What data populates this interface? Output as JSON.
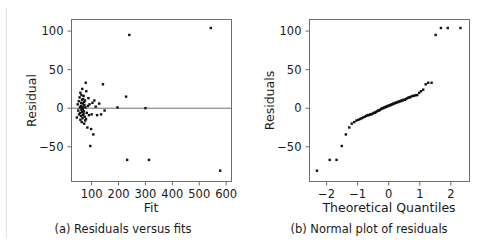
{
  "figure": {
    "panels": [
      {
        "id": "a",
        "caption": "(a) Residuals versus fits"
      },
      {
        "id": "b",
        "caption": "(b) Normal plot of residuals"
      }
    ]
  },
  "chart_data": [
    {
      "type": "scatter",
      "id": "residuals-versus-fits",
      "title": "(a) Residuals versus fits",
      "xlabel": "Fit",
      "ylabel": "Residual",
      "xlim": [
        25,
        620
      ],
      "ylim": [
        -95,
        115
      ],
      "xticks": [
        100,
        200,
        300,
        400,
        500,
        600
      ],
      "xtick_labels": [
        "100",
        "200",
        "300",
        "400",
        "500",
        "600"
      ],
      "yticks": [
        -50,
        0,
        50,
        100
      ],
      "ytick_labels": [
        "−50",
        "0",
        "50",
        "100"
      ],
      "grid": false,
      "legend": false,
      "reference_line": {
        "orientation": "horizontal",
        "y": 0
      },
      "marker": {
        "shape": "square",
        "size": 2.4,
        "color": "#111111"
      },
      "x": [
        45,
        48,
        50,
        52,
        53,
        55,
        56,
        57,
        58,
        58,
        60,
        60,
        61,
        62,
        62,
        63,
        64,
        64,
        65,
        65,
        66,
        67,
        67,
        68,
        68,
        69,
        70,
        70,
        71,
        72,
        72,
        73,
        74,
        75,
        76,
        77,
        78,
        79,
        80,
        82,
        84,
        86,
        88,
        90,
        92,
        95,
        98,
        100,
        103,
        106,
        110,
        115,
        120,
        128,
        135,
        142,
        148,
        196,
        228,
        232,
        240,
        300,
        313,
        543,
        578
      ],
      "y": [
        -12,
        5,
        -3,
        9,
        -8,
        14,
        1,
        -6,
        20,
        -15,
        3,
        -10,
        7,
        -2,
        17,
        -18,
        11,
        0,
        -5,
        25,
        -13,
        6,
        -1,
        12,
        -9,
        2,
        -7,
        16,
        -4,
        8,
        -20,
        4,
        -11,
        10,
        -16,
        1,
        33,
        -14,
        22,
        -6,
        -25,
        3,
        13,
        -9,
        5,
        -49,
        -27,
        -8,
        7,
        -34,
        10,
        2,
        -9,
        6,
        -8,
        31,
        -3,
        1,
        15,
        -67,
        95,
        0,
        -67,
        104,
        -81
      ]
    },
    {
      "type": "scatter",
      "id": "normal-plot-of-residuals",
      "title": "(b) Normal plot of residuals",
      "xlabel": "Theoretical Quantiles",
      "ylabel": "Residuals",
      "xlim": [
        -2.55,
        2.6
      ],
      "ylim": [
        -95,
        115
      ],
      "xticks": [
        -2,
        -1,
        0,
        1,
        2
      ],
      "xtick_labels": [
        "−2",
        "−1",
        "0",
        "1",
        "2"
      ],
      "yticks": [
        -50,
        0,
        50,
        100
      ],
      "ytick_labels": [
        "−50",
        "0",
        "50",
        "100"
      ],
      "grid": false,
      "legend": false,
      "marker": {
        "shape": "square",
        "size": 2.4,
        "color": "#111111"
      },
      "x": [
        -2.31,
        -1.9,
        -1.68,
        -1.51,
        -1.38,
        -1.27,
        -1.19,
        -1.11,
        -1.04,
        -0.98,
        -0.92,
        -0.87,
        -0.82,
        -0.77,
        -0.72,
        -0.68,
        -0.64,
        -0.6,
        -0.56,
        -0.52,
        -0.48,
        -0.45,
        -0.41,
        -0.38,
        -0.34,
        -0.31,
        -0.28,
        -0.24,
        -0.21,
        -0.18,
        -0.15,
        -0.12,
        -0.09,
        -0.06,
        -0.03,
        0.0,
        0.03,
        0.06,
        0.09,
        0.12,
        0.15,
        0.18,
        0.21,
        0.24,
        0.28,
        0.31,
        0.34,
        0.38,
        0.41,
        0.45,
        0.48,
        0.52,
        0.56,
        0.6,
        0.64,
        0.68,
        0.72,
        0.77,
        0.82,
        0.87,
        0.92,
        0.98,
        1.04,
        1.11,
        1.19,
        1.27,
        1.38,
        1.51,
        1.68,
        1.9,
        2.31
      ],
      "y": [
        -81,
        -67,
        -67,
        -49,
        -34,
        -25,
        -20,
        -18,
        -16,
        -15,
        -14,
        -13,
        -12,
        -11,
        -10,
        -9,
        -9,
        -8,
        -8,
        -7,
        -6,
        -6,
        -5,
        -4,
        -3,
        -3,
        -2,
        -1,
        0,
        0,
        1,
        1,
        2,
        2,
        3,
        3,
        4,
        4,
        5,
        5,
        6,
        6,
        7,
        7,
        8,
        8,
        9,
        9,
        10,
        10,
        11,
        11,
        12,
        13,
        14,
        14,
        15,
        16,
        16,
        17,
        17,
        20,
        22,
        24,
        31,
        33,
        33,
        95,
        104,
        104,
        104
      ]
    }
  ]
}
